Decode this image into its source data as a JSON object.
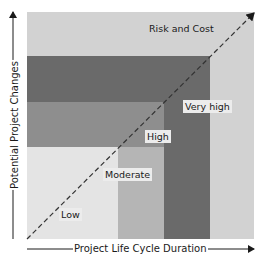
{
  "diagram": {
    "type": "risk-zone-diagram",
    "x_axis_label": "Project Life Cycle Duration",
    "y_axis_label": "Potential Project Changes",
    "diagonal_label": "Risk and Cost",
    "zones": [
      {
        "name": "Low",
        "color": "#e4e4e4"
      },
      {
        "name": "Moderate",
        "color": "#b5b5b5"
      },
      {
        "name": "High",
        "color": "#8e8e8e"
      },
      {
        "name": "Very high",
        "color": "#6a6a6a"
      }
    ],
    "outer_color": "#d2d2d2"
  }
}
